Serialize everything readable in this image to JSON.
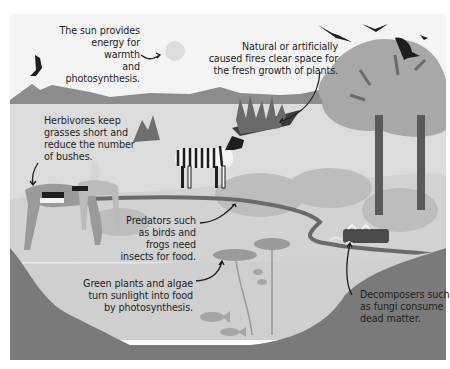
{
  "diagram": {
    "type": "illustrated ecosystem diagram (grayscale)",
    "elements": {
      "sun": "sun-icon",
      "birds": [
        "bird-left",
        "bird-flying-1",
        "bird-flying-2",
        "bird-small",
        "bird-perched"
      ],
      "animals": [
        "zebra",
        "antelope-grazing",
        "antelope-standing",
        "fish-1",
        "fish-2",
        "fish-3",
        "fish-4"
      ],
      "features": [
        "mountains",
        "savanna",
        "fire-patch",
        "termite-mound",
        "acacia-trees",
        "river",
        "pond",
        "lily-pads",
        "fallen-log",
        "mushrooms",
        "riverbank"
      ]
    },
    "annotations": [
      {
        "id": "sun",
        "text": "The sun provides\nenergy for warmth\nand photosynthesis."
      },
      {
        "id": "fire",
        "text": "Natural or artificially\ncaused fires clear space for\nthe fresh growth of plants."
      },
      {
        "id": "herbivores",
        "text": "Herbivores keep\ngrasses short and\nreduce the number\nof bushes."
      },
      {
        "id": "predators",
        "text": "Predators such\nas birds and\nfrogs need\ninsects for food."
      },
      {
        "id": "plants",
        "text": "Green plants and algae\nturn sunlight into food\nby photosynthesis."
      },
      {
        "id": "decomposers",
        "text": "Decomposers such\nas fungi consume\ndead matter."
      }
    ],
    "colors": {
      "sky": "#f4f4f4",
      "mountains": "#8c8c8c",
      "ground": "#dcdcdc",
      "tree_canopy": "#a8a8a8",
      "trunk": "#5a5a5a",
      "water": "#cfcfcf",
      "bank": "#7a7a7a",
      "dark": "#262626",
      "sun": "#dcdcdc"
    }
  }
}
